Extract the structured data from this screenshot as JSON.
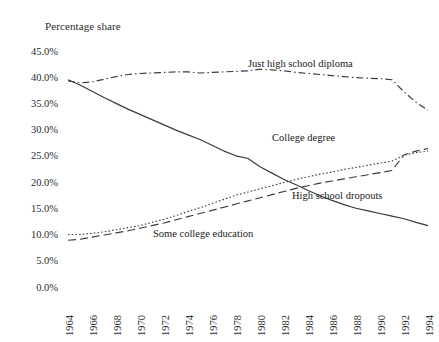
{
  "chart_data": {
    "type": "line",
    "title": "Percentage share",
    "xlabel": "",
    "ylabel": "Percentage share",
    "grid": false,
    "legend_position": "inline-annotations",
    "xlim": [
      1964,
      1994
    ],
    "ylim": [
      0,
      45
    ],
    "x": [
      1964,
      1965,
      1966,
      1967,
      1968,
      1969,
      1970,
      1971,
      1972,
      1973,
      1974,
      1975,
      1976,
      1977,
      1978,
      1979,
      1980,
      1981,
      1982,
      1983,
      1984,
      1985,
      1986,
      1987,
      1988,
      1989,
      1990,
      1991,
      1992,
      1993,
      1994
    ],
    "xticks": [
      "1964",
      "1966",
      "1968",
      "1970",
      "1972",
      "1974",
      "1976",
      "1978",
      "1980",
      "1982",
      "1984",
      "1986",
      "1988",
      "1990",
      "1992",
      "1994"
    ],
    "yticks": [
      "0.0%",
      "5.0%",
      "10.0%",
      "15.0%",
      "20.0%",
      "25.0%",
      "30.0%",
      "35.0%",
      "40.0%",
      "45.0%"
    ],
    "ytick_values": [
      0,
      5,
      10,
      15,
      20,
      25,
      30,
      35,
      40,
      45
    ],
    "series": [
      {
        "name": "Just high school diploma",
        "style": "dash-dot",
        "label_x": 1982,
        "label_y": 43.2,
        "values": [
          39.6,
          39.2,
          39.4,
          39.9,
          40.4,
          40.8,
          41.0,
          41.1,
          41.2,
          41.3,
          41.3,
          41.1,
          41.2,
          41.3,
          41.4,
          41.5,
          41.8,
          41.7,
          41.5,
          41.2,
          41.0,
          40.8,
          40.6,
          40.4,
          40.2,
          40.1,
          40.0,
          39.8,
          37.5,
          35.5,
          34.0
        ]
      },
      {
        "name": "High school dropouts",
        "style": "solid",
        "label_x": 1986,
        "label_y": 18.6,
        "values": [
          39.8,
          38.8,
          37.6,
          36.4,
          35.3,
          34.2,
          33.2,
          32.2,
          31.2,
          30.2,
          29.3,
          28.4,
          27.3,
          26.2,
          25.3,
          24.8,
          23.2,
          22.0,
          20.8,
          19.8,
          18.7,
          17.7,
          16.8,
          16.0,
          15.3,
          14.8,
          14.3,
          13.8,
          13.3,
          12.6,
          12.0
        ]
      },
      {
        "name": "Some college education",
        "style": "dotted",
        "label_x": 1974,
        "label_y": 9.0,
        "values": [
          10.3,
          10.3,
          10.5,
          10.8,
          11.2,
          11.6,
          12.0,
          12.6,
          13.2,
          13.9,
          14.7,
          15.4,
          16.2,
          17.0,
          17.8,
          18.4,
          19.0,
          19.6,
          20.2,
          20.8,
          21.3,
          21.8,
          22.2,
          22.7,
          23.1,
          23.5,
          23.9,
          24.3,
          25.4,
          25.9,
          26.2
        ]
      },
      {
        "name": "College degree",
        "style": "long-dash",
        "label_x": 1983,
        "label_y": 28.8,
        "values": [
          9.2,
          9.4,
          9.8,
          10.2,
          10.6,
          11.0,
          11.5,
          12.0,
          12.5,
          13.1,
          13.7,
          14.3,
          14.9,
          15.5,
          16.1,
          16.7,
          17.3,
          17.9,
          18.5,
          19.1,
          19.6,
          20.1,
          20.5,
          20.9,
          21.3,
          21.7,
          22.1,
          22.5,
          25.5,
          26.2,
          26.7
        ]
      }
    ]
  },
  "labels": {
    "chart_title": "Percentage share",
    "diploma": "Just high school diploma",
    "college_degree": "College degree",
    "dropouts": "High school dropouts",
    "some_college": "Some college education"
  }
}
